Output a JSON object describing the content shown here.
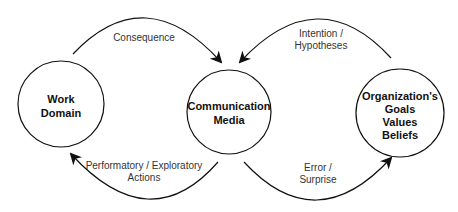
{
  "diagram": {
    "nodes": [
      {
        "id": "work-domain",
        "lines": [
          "Work",
          "Domain"
        ],
        "cx": 61,
        "cy": 115,
        "r": 43
      },
      {
        "id": "communication-media",
        "lines": [
          "Communication",
          "Media"
        ],
        "cx": 229,
        "cy": 113,
        "r": 43
      },
      {
        "id": "organization",
        "lines": [
          "Organization's",
          "Goals",
          "Values",
          "Beliefs"
        ],
        "cx": 400,
        "cy": 113,
        "r": 44
      }
    ],
    "edges": [
      {
        "id": "consequence",
        "from": "work-domain",
        "to": "communication-media",
        "lines": [
          "Consequence"
        ]
      },
      {
        "id": "intention-hypotheses",
        "from": "organization",
        "to": "communication-media",
        "lines": [
          "Intention /",
          "Hypotheses"
        ]
      },
      {
        "id": "performatory-exploratory-actions",
        "from": "communication-media",
        "to": "work-domain",
        "lines": [
          "Performatory / Exploratory",
          "Actions"
        ]
      },
      {
        "id": "error-surprise",
        "from": "communication-media",
        "to": "organization",
        "lines": [
          "Error /",
          "Surprise"
        ]
      }
    ],
    "colors": {
      "stroke": "#111111",
      "text": "#333333",
      "background": "#ffffff"
    }
  }
}
